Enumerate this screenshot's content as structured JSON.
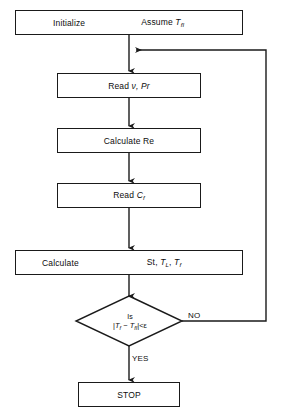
{
  "diagram": {
    "type": "flowchart",
    "nodes": [
      {
        "id": "initialize",
        "shape": "process",
        "labels": [
          "Initialize",
          "Assume T_fI"
        ],
        "label_left": "Initialize",
        "label_right_prefix": "Assume ",
        "label_right_var": "T",
        "label_right_sub": "fI"
      },
      {
        "id": "read-nu-pr",
        "shape": "process",
        "label": "Read ν, Pr",
        "label_prefix": "Read ",
        "label_symbols": "ν, Pr"
      },
      {
        "id": "calculate-re",
        "shape": "process",
        "label": "Calculate  Re"
      },
      {
        "id": "read-cf",
        "shape": "process",
        "label": "Read C_f",
        "label_prefix": "Read ",
        "label_var": "C",
        "label_sub": "f"
      },
      {
        "id": "calculate-st-tl-tf",
        "shape": "process",
        "labels": [
          "Calculate",
          "St, T_L, T_f"
        ],
        "label_left": "Calculate",
        "label_right": "St, T_L, T_f"
      },
      {
        "id": "decision-converged",
        "shape": "diamond",
        "line1": "Is",
        "line2": "|T_f − T_fI| < ε",
        "condition_text": "Is |T_f − T_fI| < ε"
      },
      {
        "id": "stop",
        "shape": "terminator",
        "label": "STOP"
      }
    ],
    "edge_labels": {
      "no": "NO",
      "yes": "YES"
    },
    "colors": {
      "stroke": "#1a1a1a",
      "fill": "#ffffff",
      "text": "#0d0d0d"
    }
  }
}
